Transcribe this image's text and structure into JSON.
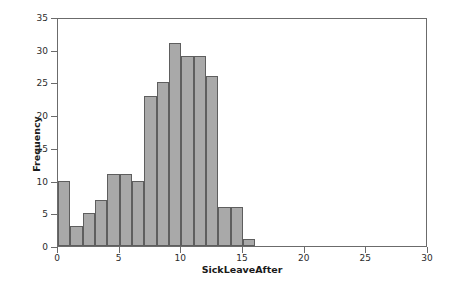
{
  "chart_data": {
    "type": "bar",
    "title": "",
    "subtitle": "",
    "xlabel": "SickLeaveAfter",
    "ylabel": "Frequency",
    "xlim": [
      0,
      30
    ],
    "ylim": [
      0,
      35
    ],
    "xticks": [
      0,
      5,
      10,
      15,
      20,
      25,
      30
    ],
    "yticks": [
      0,
      5,
      10,
      15,
      20,
      25,
      30,
      35
    ],
    "xtick_labels": [
      "0",
      "5",
      "10",
      "15",
      "20",
      "25",
      "30"
    ],
    "ytick_labels": [
      "0",
      "5",
      "10",
      "15",
      "20",
      "25",
      "30",
      "35"
    ],
    "grid": false,
    "legend": false,
    "legend_position": "none",
    "bin_width": 1,
    "bin_starts": [
      0,
      1,
      2,
      3,
      4,
      5,
      6,
      7,
      8,
      9,
      10,
      11,
      12,
      13,
      14,
      15
    ],
    "categories": [
      "0-1",
      "1-2",
      "2-3",
      "3-4",
      "4-5",
      "5-6",
      "6-7",
      "7-8",
      "8-9",
      "9-10",
      "10-11",
      "11-12",
      "12-13",
      "13-14",
      "14-15",
      "15-16"
    ],
    "values": [
      10,
      3,
      5,
      7,
      11,
      11,
      10,
      23,
      25,
      31,
      29,
      29,
      26,
      6,
      6,
      1
    ],
    "bar_fill_color": "#a9a9a9",
    "bar_edge_color": "#5e5e5e",
    "axis_color": "#6b6b6b",
    "background_color": "#ffffff"
  }
}
